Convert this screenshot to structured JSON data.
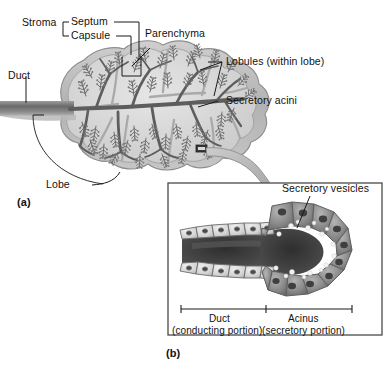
{
  "figure": {
    "background_color": "#ffffff",
    "ink_color": "#1a1a1a"
  },
  "panel_a": {
    "tag": "(a)",
    "labels": {
      "stroma": "Stroma",
      "septum": "Septum",
      "capsule": "Capsule",
      "parenchyma": "Parenchyma",
      "lobules": "Lobules (within lobe)",
      "secretory_acini": "Secretory acini",
      "duct": "Duct",
      "lobe": "Lobe"
    },
    "colors": {
      "capsule": "#b9b9b9",
      "lobule_fill": "#d8d8d8",
      "septum": "#a9a9a9",
      "duct_tree": "#5d5d5d",
      "acinus_feather": "#6e6e6e",
      "outline": "#6b6b6b"
    }
  },
  "magnifier": {
    "box_name": "magnified-region-box",
    "arrow_name": "magnification-arrow",
    "arrow_color": "#b0b0b0"
  },
  "panel_b": {
    "tag": "(b)",
    "labels": {
      "secretory_vesicles": "Secretory vesicles",
      "duct_title": "Duct",
      "duct_sub": "(conducting portion)",
      "acinus_title": "Acinus",
      "acinus_sub": "(secretory portion)"
    },
    "colors": {
      "border": "#4a4a4a",
      "duct_cell": "#dcdcdc",
      "acinus_cell": "#8e8e8e",
      "lumen": "#3b3b3b",
      "vesicle": "#f2f2f2",
      "nucleus": "#4a4a4a"
    }
  }
}
